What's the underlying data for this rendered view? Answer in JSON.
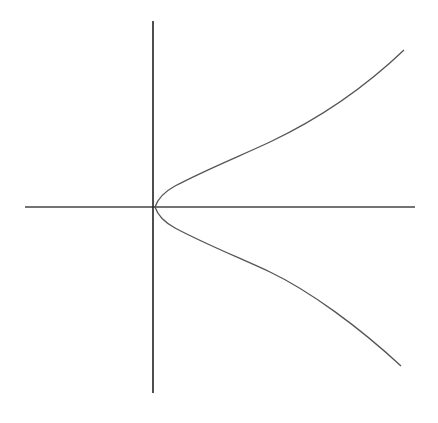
{
  "diagram": {
    "stroke_color": "#333333",
    "curve_color": "#555555",
    "axes": {
      "x_axis": {
        "from": [
          25,
          207
        ],
        "to": [
          415,
          207
        ]
      },
      "y_axis": {
        "from": [
          153,
          21
        ],
        "to": [
          153,
          393
        ]
      }
    },
    "curve": {
      "upper_branch": "M155,207 C158,198 164,192 175,186 C205,170 240,156 270,142 C310,123 360,92 404,50",
      "lower_branch": "M155,207 C158,216 164,222 175,228 C205,244 240,258 270,272 C310,291 360,328 401,366"
    }
  }
}
